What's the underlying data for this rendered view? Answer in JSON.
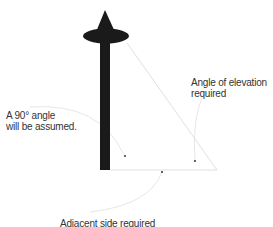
{
  "diagram": {
    "labels": {
      "right_angle_line1": "A 90° angle",
      "right_angle_line2": "will be assumed.",
      "angle_elevation_line1": "Angle of elevation",
      "angle_elevation_line2": "required",
      "adjacent_side": "Adjacent side required"
    },
    "colors": {
      "pole": "#1a1a1a",
      "lines": "#d8d8d8",
      "text": "#333333"
    }
  }
}
